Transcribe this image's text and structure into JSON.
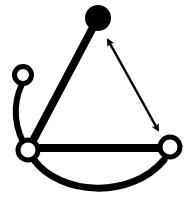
{
  "diagram": {
    "title": "",
    "background": "#ffffff",
    "stroke_color": "#000000",
    "nodes": [
      {
        "id": "top",
        "label": "",
        "cx": 98,
        "cy": 18,
        "r": 13,
        "filled": true
      },
      {
        "id": "small-left",
        "label": "",
        "cx": 23,
        "cy": 75,
        "r": 8.5,
        "filled": false
      },
      {
        "id": "bottom-left",
        "label": "",
        "cx": 28,
        "cy": 150,
        "r": 10,
        "filled": false
      },
      {
        "id": "bottom-right",
        "label": "",
        "cx": 170,
        "cy": 147,
        "r": 10,
        "filled": false
      }
    ],
    "edges": [
      {
        "id": "top-to-bottom-left",
        "from": "top",
        "to": "bottom-left",
        "style": "thick-line"
      },
      {
        "id": "bottom-left-to-bottom-right",
        "from": "bottom-left",
        "to": "bottom-right",
        "style": "thick-line"
      },
      {
        "id": "small-left-to-bottom-left",
        "from": "small-left",
        "to": "bottom-left",
        "style": "curved-line"
      },
      {
        "id": "bottom-arc",
        "from": "bottom-left",
        "to": "bottom-right",
        "style": "curved-arc"
      },
      {
        "id": "top-bottom-right-arrow",
        "from": "top",
        "to": "bottom-right",
        "style": "double-headed-arrow"
      }
    ]
  }
}
